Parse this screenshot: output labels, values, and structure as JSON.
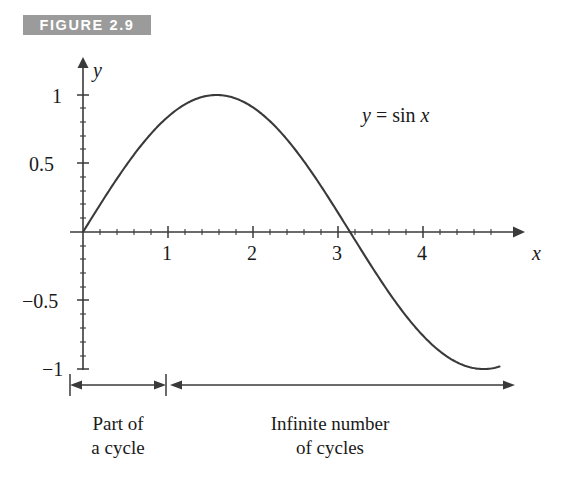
{
  "figure": {
    "banner_label": "FIGURE 2.9",
    "banner_bg_color": "#9b9b9b",
    "banner_text_color": "#ffffff",
    "background_color": "#ffffff",
    "curve_color": "#3a3a3a",
    "axis_color": "#3a3a3a"
  },
  "chart_data": {
    "type": "line",
    "title": "FIGURE 2.9",
    "equation": "y = sin x",
    "equation_parts": {
      "lhs": "y",
      "eq": " = ",
      "fn": "sin",
      "arg": "x"
    },
    "xlabel": "x",
    "ylabel": "y",
    "xlim": [
      -0.08,
      5.15
    ],
    "ylim": [
      -1.22,
      1.22
    ],
    "xticks": [
      1,
      2,
      3,
      4
    ],
    "xtick_labels": [
      "1",
      "2",
      "3",
      "4"
    ],
    "yticks": [
      1,
      0.5,
      -0.5,
      -1
    ],
    "ytick_labels": [
      "1",
      "0.5",
      "−0.5",
      "−1"
    ],
    "minor_tick_step_x": 0.2,
    "minor_tick_step_y": 0.1,
    "grid": false,
    "legend": false,
    "series": [
      {
        "name": "y = sin x",
        "function": "sin",
        "x_start": 0,
        "x_end": 4.9,
        "key_points": [
          {
            "x": 0,
            "y": 0
          },
          {
            "x": 0.5,
            "y": 0.479
          },
          {
            "x": 1,
            "y": 0.841
          },
          {
            "x": 1.5708,
            "y": 1
          },
          {
            "x": 2,
            "y": 0.909
          },
          {
            "x": 2.5,
            "y": 0.599
          },
          {
            "x": 3.1416,
            "y": 0
          },
          {
            "x": 3.5,
            "y": -0.351
          },
          {
            "x": 4,
            "y": -0.757
          },
          {
            "x": 4.5,
            "y": -0.978
          },
          {
            "x": 4.712,
            "y": -1
          },
          {
            "x": 4.9,
            "y": -0.982
          }
        ]
      }
    ],
    "annotations": [
      {
        "id": "part-of-a-cycle",
        "text": "Part of\na cycle",
        "x_range": [
          0,
          1
        ]
      },
      {
        "id": "infinite-number-of-cycles",
        "text": "Infinite number\nof cycles",
        "x_range": [
          1,
          5.1
        ]
      }
    ]
  },
  "spans": {
    "left": {
      "line1": "Part of",
      "line2": "a cycle"
    },
    "right": {
      "line1": "Infinite number",
      "line2": "of cycles"
    }
  }
}
